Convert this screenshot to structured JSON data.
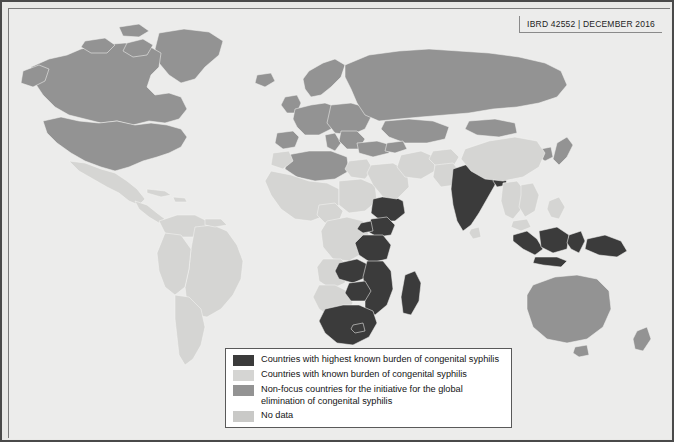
{
  "figure": {
    "credit": "IBRD 42552  |  DECEMBER 2016",
    "frame_color": "#4a4a4a",
    "ocean_color": "#ececeb"
  },
  "legend": {
    "title": "",
    "items": [
      {
        "label": "Countries with highest known burden of congenital syphilis",
        "color": "#3b3b3b",
        "category": "highest-burden"
      },
      {
        "label": "Countries with known burden of congenital syphilis",
        "color": "#d5d5d3",
        "category": "known-burden"
      },
      {
        "label": "Non-focus countries for the initiative for the global elimination of congenital syphilis",
        "color": "#939393",
        "category": "non-focus"
      },
      {
        "label": "No data",
        "color": "#c9c9c7",
        "category": "no-data"
      }
    ]
  },
  "map_data": {
    "type": "choropleth",
    "projection": "robinson-like",
    "categories": [
      "highest-burden",
      "known-burden",
      "non-focus",
      "no-data"
    ],
    "category_colors": {
      "highest-burden": "#3b3b3b",
      "known-burden": "#d5d5d3",
      "non-focus": "#939393",
      "no-data": "#c9c9c7"
    },
    "regions": {
      "highest-burden": [
        "India",
        "Ethiopia",
        "Kenya",
        "Tanzania",
        "Uganda",
        "Zambia",
        "Zimbabwe",
        "Mozambique",
        "South Africa",
        "Madagascar",
        "Indonesia",
        "Papua New Guinea"
      ],
      "known-burden": [
        "Mexico",
        "Central America",
        "Colombia",
        "Venezuela",
        "Brazil",
        "Peru",
        "Bolivia",
        "Chile",
        "Argentina",
        "Paraguay",
        "Uruguay",
        "Ecuador",
        "Guyana",
        "Suriname",
        "West Africa",
        "Nigeria",
        "Sudan",
        "Angola",
        "Congo",
        "Namibia",
        "Botswana",
        "Egypt",
        "China",
        "Pakistan",
        "Bangladesh",
        "Myanmar",
        "Thailand",
        "Vietnam",
        "Philippines",
        "Saudi Arabia",
        "Iran"
      ],
      "non-focus": [
        "Canada",
        "United States",
        "Greenland",
        "Russia",
        "Europe",
        "Scandinavia",
        "Turkey",
        "Kazakhstan",
        "Mongolia",
        "Japan",
        "Korea",
        "Australia",
        "New Zealand",
        "Libya",
        "Algeria"
      ]
    }
  }
}
